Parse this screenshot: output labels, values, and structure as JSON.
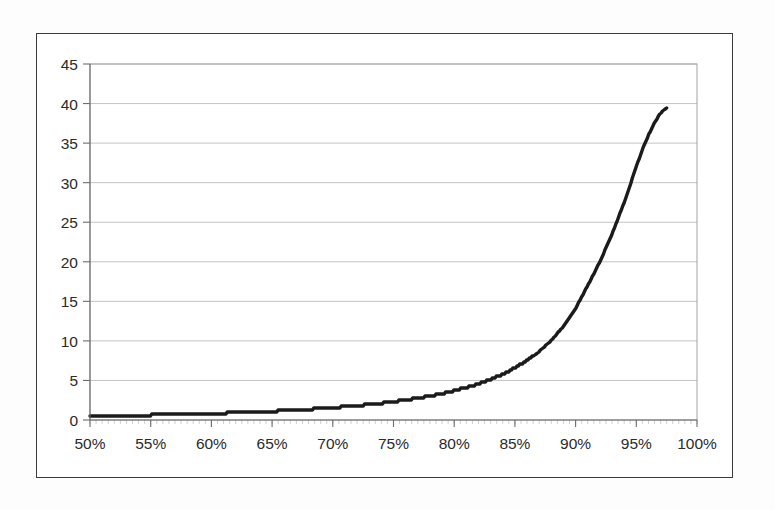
{
  "figure": {
    "title": "",
    "background": "#ffffff",
    "frame_color": "#3b3b3b"
  },
  "chart_data": {
    "type": "line",
    "title": "",
    "subtitle": "",
    "xlabel": "",
    "ylabel": "",
    "xlim": [
      50,
      100
    ],
    "ylim": [
      0,
      45
    ],
    "grid": true,
    "grid_axis": "y",
    "legend": false,
    "legend_position": "none",
    "xtick_labels": [
      "50%",
      "55%",
      "60%",
      "65%",
      "70%",
      "75%",
      "80%",
      "85%",
      "90%",
      "95%",
      "100%"
    ],
    "xticks": [
      50,
      55,
      60,
      65,
      70,
      75,
      80,
      85,
      90,
      95,
      100
    ],
    "ytick_labels": [
      "0",
      "5",
      "10",
      "15",
      "20",
      "25",
      "30",
      "35",
      "40",
      "45"
    ],
    "yticks": [
      0,
      5,
      10,
      15,
      20,
      25,
      30,
      35,
      40,
      45
    ],
    "series": [
      {
        "name": "curve",
        "color": "#1b1b1b",
        "line_width": 3.4,
        "x": [
          50.0,
          51.0,
          52.0,
          53.0,
          54.0,
          55.0,
          56.0,
          57.0,
          58.0,
          59.0,
          60.0,
          61.0,
          62.0,
          63.0,
          64.0,
          65.0,
          66.0,
          67.0,
          68.0,
          69.0,
          70.0,
          71.0,
          72.0,
          73.0,
          74.0,
          75.0,
          76.0,
          77.0,
          78.0,
          79.0,
          80.0,
          81.0,
          82.0,
          83.0,
          84.0,
          85.0,
          86.0,
          87.0,
          88.0,
          89.0,
          90.0,
          91.0,
          92.0,
          93.0,
          94.0,
          95.0,
          95.5,
          96.0,
          96.5,
          97.0,
          97.5
        ],
        "values": [
          0.5,
          0.52,
          0.54,
          0.57,
          0.6,
          0.63,
          0.66,
          0.7,
          0.74,
          0.78,
          0.82,
          0.87,
          0.92,
          0.98,
          1.04,
          1.11,
          1.18,
          1.26,
          1.35,
          1.45,
          1.56,
          1.68,
          1.81,
          1.96,
          2.13,
          2.32,
          2.53,
          2.77,
          3.04,
          3.35,
          3.7,
          4.11,
          4.58,
          5.14,
          5.8,
          6.58,
          7.52,
          8.67,
          10.08,
          11.85,
          14.1,
          17.0,
          20.0,
          23.5,
          27.5,
          32.0,
          34.2,
          36.0,
          37.6,
          38.8,
          39.5
        ]
      }
    ]
  },
  "axes": {
    "x_axis_name": "percentage-axis",
    "y_axis_name": "value-axis"
  }
}
